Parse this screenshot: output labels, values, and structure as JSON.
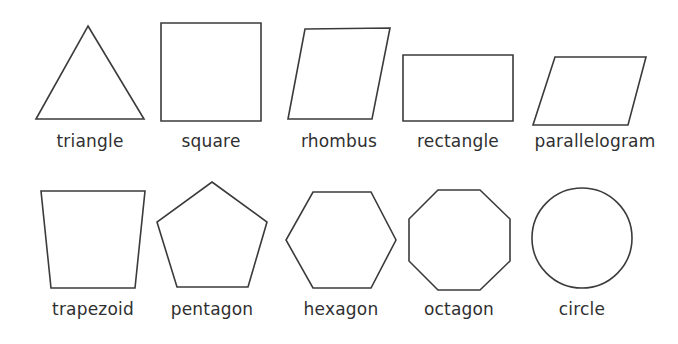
{
  "page": {
    "background_color": "#ffffff",
    "stroke_color": "#3b3b3d",
    "fill_color": "#ffffff",
    "label_color": "#2f2f31"
  },
  "rows": [
    {
      "index": 0,
      "shapes": [
        {
          "name": "triangle",
          "label": "triangle",
          "type": "polygon",
          "sides": 3,
          "points": "88,26 144,119 36,119",
          "label_left": 20,
          "label_top": 131,
          "label_width": 140
        },
        {
          "name": "square",
          "label": "square",
          "type": "polygon",
          "sides": 4,
          "points": "161,23 261,23 261,121 161,121",
          "label_left": 141,
          "label_top": 131,
          "label_width": 140
        },
        {
          "name": "rhombus",
          "label": "rhombus",
          "type": "polygon",
          "sides": 4,
          "points": "305,29 390,28 372,119 288,119",
          "label_left": 269,
          "label_top": 131,
          "label_width": 140
        },
        {
          "name": "rectangle",
          "label": "rectangle",
          "type": "polygon",
          "sides": 4,
          "points": "403,55 513,55 513,121 403,121",
          "label_left": 388,
          "label_top": 131,
          "label_width": 140
        },
        {
          "name": "parallelogram",
          "label": "parallelogram",
          "type": "polygon",
          "sides": 4,
          "points": "555,57 646,57 628,125 533,125",
          "label_left": 520,
          "label_top": 131,
          "label_width": 150
        }
      ]
    },
    {
      "index": 1,
      "shapes": [
        {
          "name": "trapezoid",
          "label": "trapezoid",
          "type": "polygon",
          "sides": 4,
          "points": "41,191 145,191 135,288 51,288",
          "label_left": 23,
          "label_top": 299,
          "label_width": 140
        },
        {
          "name": "pentagon",
          "label": "pentagon",
          "type": "polygon",
          "sides": 5,
          "points": "212,182 267,222 248,287 177,287 157,222",
          "label_left": 142,
          "label_top": 299,
          "label_width": 140
        },
        {
          "name": "hexagon",
          "label": "hexagon",
          "type": "polygon",
          "sides": 6,
          "points": "313,192 371,192 396,240 371,288 313,288 286,240",
          "label_left": 271,
          "label_top": 299,
          "label_width": 140
        },
        {
          "name": "octagon",
          "label": "octagon",
          "type": "polygon",
          "sides": 8,
          "points": "438,190 480,190 510,219 510,261 480,290 438,290 409,261 409,219",
          "label_left": 389,
          "label_top": 299,
          "label_width": 140
        },
        {
          "name": "circle",
          "label": "circle",
          "type": "circle",
          "sides": 0,
          "cx": 582,
          "cy": 238,
          "r": 50,
          "label_left": 512,
          "label_top": 299,
          "label_width": 140
        }
      ]
    }
  ]
}
